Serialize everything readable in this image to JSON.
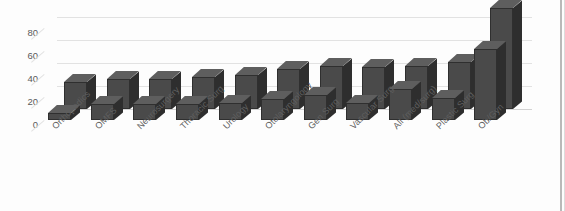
{
  "chart_data": {
    "type": "bar",
    "title": "",
    "subtitle": "",
    "xlabel": "",
    "ylabel": "",
    "ylim": [
      0,
      90
    ],
    "yticks": [
      0,
      20,
      40,
      60,
      80
    ],
    "grid": true,
    "legend": "none",
    "style": "3d-grouped-bar",
    "categories": [
      "Orthopedics",
      "OMFS",
      "Neurosurgery",
      "Thoracic Surg",
      "Urology",
      "Otolaryngology",
      "Gen Surg",
      "Vascular Surg",
      "All (med/surg)",
      "Plastic Surg",
      "Ob/Gyn"
    ],
    "series": [
      {
        "name": "Back series",
        "values": [
          24,
          26,
          26,
          28,
          30,
          35,
          38,
          37,
          38,
          41,
          88
        ]
      },
      {
        "name": "Front series",
        "values": [
          6,
          14,
          14,
          14,
          15,
          18,
          22,
          15,
          27,
          19,
          62
        ]
      }
    ]
  },
  "axis": {
    "yticks": [
      "80",
      "60",
      "40",
      "20",
      "0"
    ]
  }
}
